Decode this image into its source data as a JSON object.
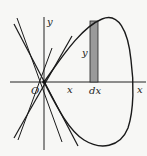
{
  "diagram": {
    "labels": {
      "y_axis": "y",
      "x_axis_end": "x",
      "origin": "O",
      "x_position": "x",
      "strip_height": "y",
      "strip_width": "dx"
    },
    "colors": {
      "background": "#f7f7f5",
      "stroke": "#1a1a1a",
      "strip_fill": "#9a9a9a"
    }
  }
}
